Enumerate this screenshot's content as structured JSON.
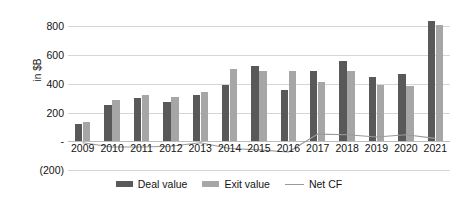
{
  "chart_data": {
    "type": "bar",
    "title": "",
    "xlabel": "",
    "ylabel": "in $B",
    "ylim": [
      -200,
      900
    ],
    "grid": true,
    "legend_position": "bottom-center",
    "categories": [
      "2009",
      "2010",
      "2011",
      "2012",
      "2013",
      "2014",
      "2015",
      "2016",
      "2017",
      "2018",
      "2019",
      "2020",
      "2021"
    ],
    "ytick_labels": [
      "800",
      "600",
      "400",
      "200",
      "-",
      "(200)"
    ],
    "ytick_values": [
      800,
      600,
      400,
      200,
      0,
      -200
    ],
    "series": [
      {
        "name": "Deal value",
        "type": "bar",
        "color": "#595959",
        "values": [
          120,
          255,
          300,
          275,
          325,
          395,
          525,
          360,
          490,
          560,
          450,
          470,
          840
        ]
      },
      {
        "name": "Exit value",
        "type": "bar",
        "color": "#a6a6a6",
        "values": [
          135,
          290,
          320,
          310,
          340,
          500,
          490,
          490,
          410,
          490,
          390,
          385,
          810
        ]
      },
      {
        "name": "Net CF",
        "type": "line",
        "color": "#9a9a9a",
        "values": [
          -10,
          -40,
          -40,
          -35,
          -10,
          -50,
          -60,
          -75,
          50,
          45,
          30,
          45,
          20
        ]
      }
    ]
  },
  "legend": {
    "items": [
      {
        "label": "Deal value",
        "swatch": "deal-swatch"
      },
      {
        "label": "Exit value",
        "swatch": "exit-swatch"
      },
      {
        "label": "Net CF",
        "swatch": "line-swatch"
      }
    ]
  },
  "colors": {
    "deal": "#595959",
    "exit": "#a6a6a6",
    "netcf": "#9a9a9a",
    "grid": "#d6d6d6",
    "text": "#131313",
    "background": "#ffffff"
  }
}
